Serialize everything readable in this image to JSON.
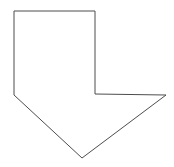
{
  "canvas": {
    "width": 174,
    "height": 167,
    "background_color": "#ffffff"
  },
  "shape": {
    "name": "down-arrow-polygon",
    "description": "Outline of an arrow-like concave polygon pointing down",
    "stroke_color": "#4d4d4d",
    "stroke_width": 1,
    "fill_color": "none",
    "points": "14,11 95,11 95,94 166,95 82,158 14,95",
    "vertices": [
      {
        "label": "top-left",
        "x": 14,
        "y": 11
      },
      {
        "label": "top-right",
        "x": 95,
        "y": 11
      },
      {
        "label": "inner-step",
        "x": 95,
        "y": 94
      },
      {
        "label": "right-tip",
        "x": 166,
        "y": 95
      },
      {
        "label": "bottom-point",
        "x": 82,
        "y": 158
      },
      {
        "label": "left-lower",
        "x": 14,
        "y": 95
      }
    ]
  }
}
